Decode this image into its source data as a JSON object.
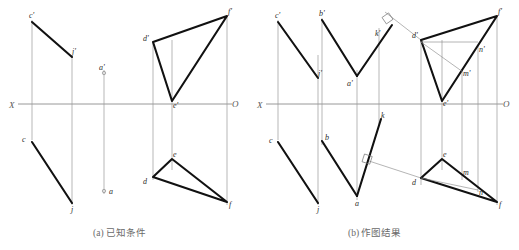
{
  "figure": {
    "title_a": "(a) 已知条件",
    "title_b": "(b) 作图结果",
    "axis_labels": {
      "x_left_a": "X",
      "o_right_a": "O",
      "x_left_b": "X",
      "o_right_b": "O"
    }
  },
  "panel_a": {
    "name": "known-conditions",
    "caption": "(a) 已知条件",
    "point_labels": {
      "c_prime": "c'",
      "j_prime": "j'",
      "c": "c",
      "j": "j",
      "a_prime": "a'",
      "a": "a",
      "d_prime": "d'",
      "e_prime": "e'",
      "f_prime": "f'",
      "d": "d",
      "e": "e",
      "f": "f"
    }
  },
  "panel_b": {
    "name": "construction-result",
    "caption": "(b) 作图结果",
    "point_labels": {
      "c_prime": "c'",
      "j_prime": "j'",
      "b_prime": "b'",
      "a_prime": "a'",
      "k_prime": "k'",
      "c": "c",
      "j": "j",
      "b": "b",
      "a": "a",
      "k": "k",
      "d_prime": "d'",
      "e_prime": "e'",
      "f_prime": "f'",
      "m_prime": "m'",
      "n_prime": "n'",
      "d": "d",
      "e": "e",
      "f": "f",
      "m": "m",
      "n": "n"
    }
  },
  "colors": {
    "ink": "#111111",
    "construction": "#8d8d8d",
    "axis": "#8d8d8d",
    "caption": "#6a6a6a",
    "background": "#ffffff"
  }
}
